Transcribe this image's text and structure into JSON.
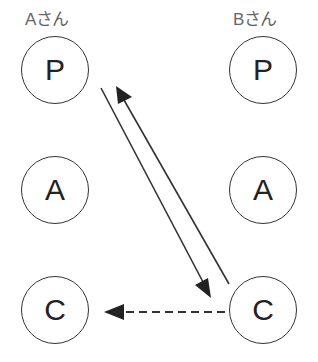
{
  "columns": [
    {
      "label": "Aさん",
      "nodes": [
        "P",
        "A",
        "C"
      ]
    },
    {
      "label": "Bさん",
      "nodes": [
        "P",
        "A",
        "C"
      ]
    }
  ],
  "edges": [
    {
      "from": "A.P",
      "to": "B.C",
      "style": "solid"
    },
    {
      "from": "B.C",
      "to": "A.P",
      "style": "solid"
    },
    {
      "from": "B.C",
      "to": "A.C",
      "style": "dashed"
    }
  ],
  "colors": {
    "stroke": "#333333",
    "label": "#666666"
  }
}
